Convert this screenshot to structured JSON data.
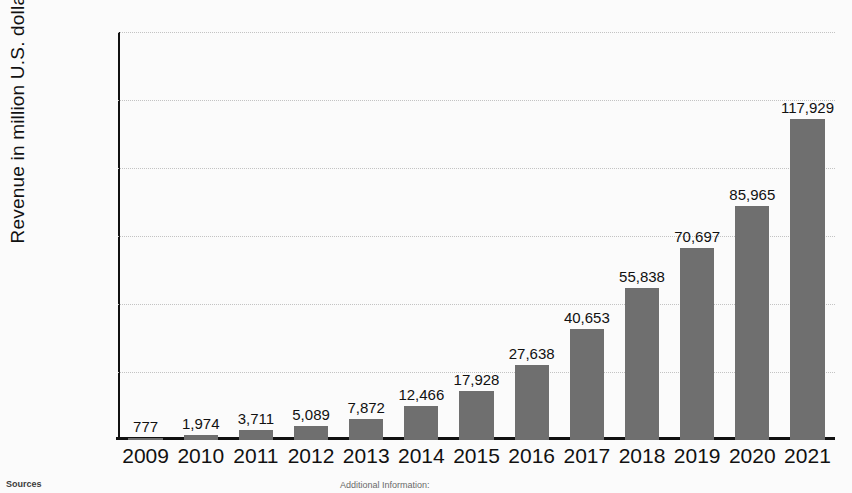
{
  "chart_data": {
    "type": "bar",
    "title": "",
    "xlabel": "",
    "ylabel": "Revenue in million U.S. dollars",
    "categories": [
      "2009",
      "2010",
      "2011",
      "2012",
      "2013",
      "2014",
      "2015",
      "2016",
      "2017",
      "2018",
      "2019",
      "2020",
      "2021"
    ],
    "values": [
      777,
      1974,
      3711,
      5089,
      7872,
      12466,
      17928,
      27638,
      40653,
      55838,
      70697,
      85965,
      117929
    ],
    "value_labels": [
      "777",
      "1,974",
      "3,711",
      "5,089",
      "7,872",
      "12,466",
      "17,928",
      "27,638",
      "40,653",
      "55,838",
      "70,697",
      "85,965",
      "117,929"
    ],
    "ylim": [
      0,
      150000
    ],
    "ytick_values": [
      0,
      25000,
      50000,
      75000,
      100000,
      125000,
      150000
    ],
    "ytick_labels": [
      "0",
      "25,000",
      "50,000",
      "75,000",
      "100,000",
      "125,000",
      "150,000"
    ],
    "grid": true,
    "legend": null,
    "bar_color": "#6f6f6f",
    "gridline_color": "#c3c3c3",
    "axis_color": "#111111"
  },
  "footer": {
    "sources_label": "Sources",
    "sources_detail": "Additional Information:"
  }
}
